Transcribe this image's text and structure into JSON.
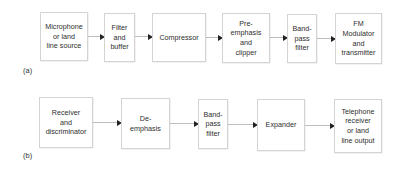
{
  "diagram": {
    "type": "block-diagram",
    "panels": [
      {
        "id": "a",
        "label": "(a)",
        "blocks": [
          {
            "id": "a1",
            "text": "Microphone\nor land\nline source"
          },
          {
            "id": "a2",
            "text": "Filter\nand\nbuffer"
          },
          {
            "id": "a3",
            "text": "Compressor"
          },
          {
            "id": "a4",
            "text": "Pre-\nemphasis\nand\nclipper"
          },
          {
            "id": "a5",
            "text": "Band-\npass\nfilter"
          },
          {
            "id": "a6",
            "text": "FM\nModulator\nand\ntransmitter"
          }
        ],
        "edges": [
          {
            "from": "a1",
            "to": "a2"
          },
          {
            "from": "a2",
            "to": "a3"
          },
          {
            "from": "a3",
            "to": "a4"
          },
          {
            "from": "a4",
            "to": "a5"
          },
          {
            "from": "a5",
            "to": "a6"
          }
        ]
      },
      {
        "id": "b",
        "label": "(b)",
        "blocks": [
          {
            "id": "b1",
            "text": "Receiver\nand\ndiscriminator"
          },
          {
            "id": "b2",
            "text": "De-\nemphasis"
          },
          {
            "id": "b3",
            "text": "Band-\npass\nfilter"
          },
          {
            "id": "b4",
            "text": "Expander"
          },
          {
            "id": "b5",
            "text": "Telephone\nreceiver\nor land\nline output"
          }
        ],
        "edges": [
          {
            "from": "b1",
            "to": "b2"
          },
          {
            "from": "b2",
            "to": "b3"
          },
          {
            "from": "b3",
            "to": "b4"
          },
          {
            "from": "b4",
            "to": "b5"
          }
        ]
      }
    ]
  },
  "colors": {
    "box_border": "#d4d4d4",
    "connector_line": "#bdbdbd",
    "arrowhead": "#222222",
    "text": "#2e2e2e"
  }
}
